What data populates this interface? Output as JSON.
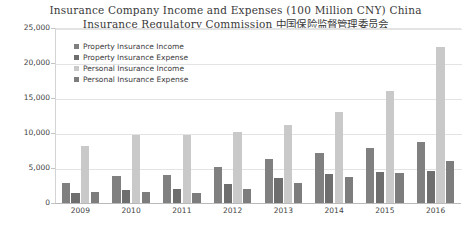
{
  "chart_data": {
    "type": "bar",
    "title": "Insurance Company Income and Expenses (100 Million CNY) China\nInsurance Regulatory Commission 中国保险监督管理委员会",
    "xlabel": "",
    "ylabel": "",
    "ylim": [
      0,
      25000
    ],
    "ytick_labels": [
      "25,000",
      "20,000",
      "15,000",
      "10,000",
      "5,000",
      "0"
    ],
    "ytick_values": [
      25000,
      20000,
      15000,
      10000,
      5000,
      0
    ],
    "grid": true,
    "legend_position": "upper-left-inside",
    "categories": [
      "2009",
      "2010",
      "2011",
      "2012",
      "2013",
      "2014",
      "2015",
      "2016"
    ],
    "series": [
      {
        "name": "Property Insurance Income",
        "color": "#808080",
        "values": [
          2900,
          3900,
          4000,
          5200,
          6300,
          7200,
          7900,
          8700
        ]
      },
      {
        "name": "Property Insurance Expense",
        "color": "#6e6e6e",
        "values": [
          1500,
          1900,
          2000,
          2700,
          3600,
          4100,
          4400,
          4600
        ]
      },
      {
        "name": "Personal Insurance Income",
        "color": "#c9c9c9",
        "values": [
          8100,
          9700,
          9700,
          10100,
          11100,
          13000,
          16000,
          22300
        ]
      },
      {
        "name": "Personal Insurance Expense",
        "color": "#7d7d7d",
        "values": [
          1600,
          1600,
          1500,
          2000,
          2900,
          3700,
          4300,
          6000
        ]
      }
    ]
  },
  "colors": {
    "background": "#ffffff",
    "grid": "#e3e3e3",
    "axis": "#b9b9b9",
    "text": "#3f3f3f",
    "title_text": "#3a3a3a"
  }
}
